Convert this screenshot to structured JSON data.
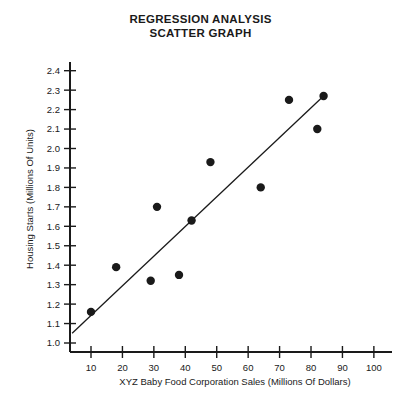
{
  "chart_data": {
    "type": "scatter",
    "title": "REGRESSION ANALYSIS SCATTER GRAPH",
    "title_lines": [
      "REGRESSION ANALYSIS",
      "SCATTER GRAPH"
    ],
    "xlabel": "XYZ Baby Food Corporation Sales (Millions Of Dollars)",
    "ylabel": "Housing Starts (Millions Of Units)",
    "xlim": [
      0,
      108
    ],
    "ylim": [
      0.95,
      2.48
    ],
    "grid": false,
    "legend": null,
    "xticks": [
      10,
      20,
      30,
      40,
      50,
      60,
      70,
      80,
      90,
      100
    ],
    "xtick_labels": [
      "10",
      "20",
      "30",
      "40",
      "50",
      "60",
      "70",
      "80",
      "90",
      "100"
    ],
    "yticks": [
      1.0,
      1.1,
      1.2,
      1.3,
      1.4,
      1.5,
      1.6,
      1.7,
      1.8,
      1.9,
      2.0,
      2.1,
      2.2,
      2.3,
      2.4
    ],
    "ytick_labels": [
      "1.0",
      "1.1",
      "1.2",
      "1.3",
      "1.4",
      "1.5",
      "1.6",
      "1.7",
      "1.8",
      "1.9",
      "2.0",
      "2.1",
      "2.2",
      "2.3",
      "2.4"
    ],
    "x": [
      10,
      18,
      29,
      31,
      38,
      42,
      48,
      64,
      73,
      82,
      84
    ],
    "y": [
      1.16,
      1.39,
      1.32,
      1.7,
      1.35,
      1.63,
      1.93,
      1.8,
      2.25,
      2.1,
      2.27
    ],
    "points": [
      {
        "x": 10,
        "y": 1.16
      },
      {
        "x": 18,
        "y": 1.39
      },
      {
        "x": 29,
        "y": 1.32
      },
      {
        "x": 31,
        "y": 1.7
      },
      {
        "x": 38,
        "y": 1.35
      },
      {
        "x": 42,
        "y": 1.63
      },
      {
        "x": 48,
        "y": 1.93
      },
      {
        "x": 64,
        "y": 1.8
      },
      {
        "x": 73,
        "y": 2.25
      },
      {
        "x": 82,
        "y": 2.1
      },
      {
        "x": 84,
        "y": 2.27
      }
    ],
    "marker_size": 4.2,
    "marker_color": "#1a1a1a",
    "regression_line": {
      "x_start": 4,
      "y_start": 1.05,
      "x_end": 84,
      "y_end": 2.27,
      "color": "#1a1a1a"
    },
    "axis_color": "#1a1a1a",
    "background_color": "#ffffff"
  }
}
